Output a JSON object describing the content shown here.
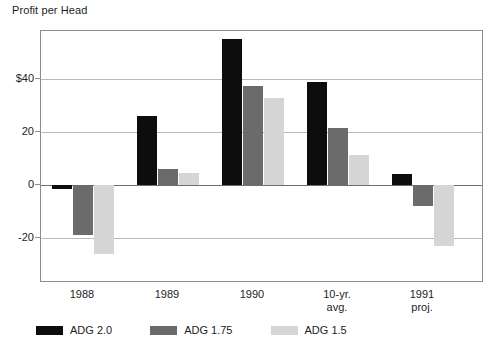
{
  "chart_data": {
    "type": "bar",
    "title": "Profit per Head",
    "xlabel": "",
    "ylabel": "",
    "categories": [
      "1988",
      "1989",
      "1990",
      "10-yr.\navg.",
      "1991\nproj."
    ],
    "category_lines": [
      [
        "1988",
        ""
      ],
      [
        "1989",
        ""
      ],
      [
        "1990",
        ""
      ],
      [
        "10-yr.",
        "avg."
      ],
      [
        "1991",
        "proj."
      ]
    ],
    "series": [
      {
        "name": "ADG 2.0",
        "color": "#0d0d0d",
        "values": [
          -1.5,
          26,
          55,
          39,
          4
        ]
      },
      {
        "name": "ADG 1.75",
        "color": "#6b6b6b",
        "values": [
          -19,
          6,
          37.5,
          21.5,
          -8
        ]
      },
      {
        "name": "ADG 1.5",
        "color": "#d5d5d5",
        "values": [
          -26,
          4.5,
          33,
          11.5,
          -23
        ]
      }
    ],
    "yticks": [
      {
        "value": 40,
        "label": "$40"
      },
      {
        "value": 20,
        "label": "20"
      },
      {
        "value": 0,
        "label": "0"
      },
      {
        "value": -20,
        "label": "-20"
      }
    ],
    "ylim": [
      -31,
      64
    ],
    "grid": true,
    "legend_position": "bottom"
  },
  "legend": {
    "items": [
      {
        "label": "ADG 2.0",
        "color": "#0d0d0d"
      },
      {
        "label": "ADG 1.75",
        "color": "#6b6b6b"
      },
      {
        "label": "ADG 1.5",
        "color": "#d5d5d5"
      }
    ]
  }
}
